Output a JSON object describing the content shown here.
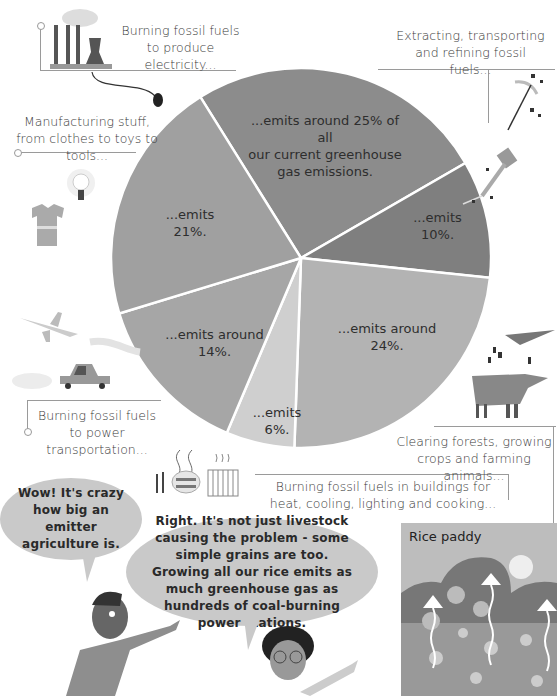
{
  "chart_data": {
    "type": "pie",
    "title": "",
    "slices": [
      {
        "label": "Burning fossil fuels to produce electricity...",
        "value_text": "...emits around 25% of all our current greenhouse gas emissions.",
        "value": 25,
        "color": "#8c8c8c",
        "start_deg": -32,
        "end_deg": 60
      },
      {
        "label": "Extracting, transporting and refining fossil fuels...",
        "value_text": "...emits 10%.",
        "value": 10,
        "color": "#7f7f7f",
        "start_deg": 60,
        "end_deg": 96
      },
      {
        "label": "Clearing forests, growing crops and farming animals...",
        "value_text": "...emits around 24%.",
        "value": 24,
        "color": "#b3b3b3",
        "start_deg": 96,
        "end_deg": 182
      },
      {
        "label": "Burning fossil fuels in buildings for heat, cooling, lighting and cooking...",
        "value_text": "...emits 6%.",
        "value": 6,
        "color": "#cfcfcf",
        "start_deg": 182,
        "end_deg": 203
      },
      {
        "label": "Burning fossil fuels to power transportation...",
        "value_text": "...emits around 14%.",
        "value": 14,
        "color": "#a6a6a6",
        "start_deg": 203,
        "end_deg": 253
      },
      {
        "label": "Manufacturing stuff, from clothes to toys to tools...",
        "value_text": "...emits 21%.",
        "value": 21,
        "color": "#a0a0a0",
        "start_deg": 253,
        "end_deg": 328
      }
    ],
    "legend": "none",
    "center": [
      301,
      258
    ],
    "radius": 190
  },
  "captions": {
    "electricity": "Burning fossil fuels to produce electricity...",
    "extracting": "Extracting, transporting and refining fossil fuels...",
    "manufacturing": "Manufacturing stuff, from clothes to toys to tools...",
    "transportation": "Burning fossil fuels to power transportation...",
    "agriculture": "Clearing forests, growing crops and farming animals...",
    "buildings": "Burning fossil fuels in buildings for heat, cooling, lighting and cooking..."
  },
  "slice_labels": {
    "electricity_line1": "...emits around 25% of all",
    "electricity_line2": "our current greenhouse",
    "electricity_line3": "gas emissions.",
    "extracting": "...emits 10%.",
    "agriculture": "...emits around 24%.",
    "buildings_line1": "...emits",
    "buildings_line2": "6%.",
    "transportation": "...emits around 14%.",
    "manufacturing": "...emits 21%."
  },
  "dialogue": {
    "boy": "Wow! It's crazy how big an emitter agriculture is.",
    "girl": "Right. It's not just livestock causing the problem - some simple grains are too. Growing all our rice emits as much greenhouse gas as hundreds of coal-burning power stations."
  },
  "inset": {
    "title": "Rice paddy"
  },
  "icons": [
    "power-plant-icon",
    "plug-icon",
    "pickaxe-icon",
    "drill-icon",
    "lightbulb-icon",
    "tshirt-icon",
    "airplane-icon",
    "car-icon",
    "tree-icon",
    "cow-icon",
    "cutlery-icon",
    "cooking-pot-icon",
    "radiator-icon"
  ]
}
